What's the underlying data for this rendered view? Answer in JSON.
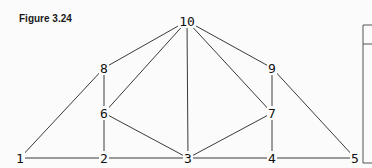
{
  "figure": {
    "title": "Figure 3.24"
  },
  "graph": {
    "nodes": [
      {
        "id": "1",
        "label": "1",
        "x": 20,
        "y": 158
      },
      {
        "id": "2",
        "label": "2",
        "x": 104,
        "y": 158
      },
      {
        "id": "3",
        "label": "3",
        "x": 188,
        "y": 158
      },
      {
        "id": "4",
        "label": "4",
        "x": 272,
        "y": 158
      },
      {
        "id": "5",
        "label": "5",
        "x": 355,
        "y": 158
      },
      {
        "id": "6",
        "label": "6",
        "x": 104,
        "y": 113
      },
      {
        "id": "7",
        "label": "7",
        "x": 272,
        "y": 113
      },
      {
        "id": "8",
        "label": "8",
        "x": 104,
        "y": 68
      },
      {
        "id": "9",
        "label": "9",
        "x": 272,
        "y": 68
      },
      {
        "id": "10",
        "label": "10",
        "x": 187,
        "y": 21
      }
    ],
    "edges": [
      [
        "1",
        "2"
      ],
      [
        "2",
        "3"
      ],
      [
        "3",
        "4"
      ],
      [
        "4",
        "5"
      ],
      [
        "1",
        "8"
      ],
      [
        "8",
        "10"
      ],
      [
        "10",
        "9"
      ],
      [
        "9",
        "5"
      ],
      [
        "8",
        "6"
      ],
      [
        "6",
        "2"
      ],
      [
        "10",
        "6"
      ],
      [
        "10",
        "3"
      ],
      [
        "10",
        "7"
      ],
      [
        "6",
        "3"
      ],
      [
        "3",
        "7"
      ],
      [
        "9",
        "7"
      ],
      [
        "7",
        "4"
      ]
    ]
  }
}
